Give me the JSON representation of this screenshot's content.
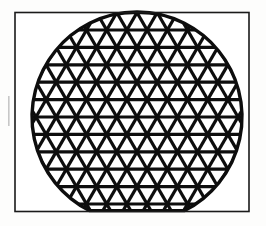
{
  "figure": {
    "title": "Geodesic Triangular Lattice Disk",
    "caption": "",
    "description": "A circular disk filled with a regular triangular (isometric) lattice of thick black struts, enclosed by a thin rectangular frame. The disk is cropped flat where it meets the bottom edge of the frame.",
    "background_color": "#fdfdfc",
    "ink_color": "#101010"
  },
  "frame": {
    "name": "rectangular-border",
    "x": 15,
    "y": 12.5,
    "width": 234,
    "height": 199,
    "stroke_width": 1.6,
    "stroke_color": "#1a1a1a",
    "fill_color": "#ffffff"
  },
  "disk": {
    "name": "lattice-disk",
    "center_x": 137,
    "center_y": 117,
    "radius": 105,
    "rim_stroke_width": 3.4,
    "rim_stroke_color": "#0d0d0d",
    "clip_bottom_y": 210.6,
    "clipped_at_bottom": true
  },
  "lattice": {
    "name": "triangular-lattice",
    "type": "isometric-triangular",
    "pitch_x": 20.2,
    "row_height": 17.4,
    "strut_width": 3.2,
    "strut_color": "#0d0d0d",
    "directions": [
      {
        "label": "horizontal",
        "angle_deg": 0
      },
      {
        "label": "rising-diagonal",
        "angle_deg": 60
      },
      {
        "label": "falling-diagonal",
        "angle_deg": -60
      }
    ],
    "rows_visible": 11,
    "columns_visible": 11,
    "origin_x": 137,
    "origin_y": 117
  },
  "margin_marks": [
    {
      "name": "left-margin-scan-mark",
      "x": 8,
      "y": 96,
      "width": 1.6,
      "height": 30,
      "color": "#9a9a9a"
    }
  ]
}
